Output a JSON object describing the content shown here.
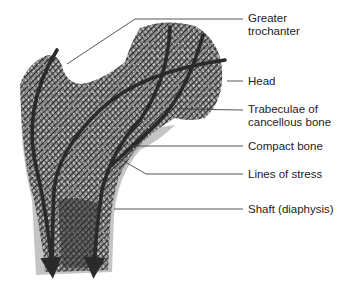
{
  "figure": {
    "labels": [
      {
        "id": "greater-trochanter",
        "lines": [
          "Greater",
          "trochanter"
        ],
        "x": 248,
        "y": 12
      },
      {
        "id": "head",
        "lines": [
          "Head"
        ],
        "x": 248,
        "y": 75
      },
      {
        "id": "trabeculae",
        "lines": [
          "Trabeculae of",
          "cancellous bone"
        ],
        "x": 248,
        "y": 103
      },
      {
        "id": "compact-bone",
        "lines": [
          "Compact bone"
        ],
        "x": 248,
        "y": 140
      },
      {
        "id": "lines-of-stress",
        "lines": [
          "Lines of stress"
        ],
        "x": 248,
        "y": 168
      },
      {
        "id": "shaft",
        "lines": [
          "Shaft (diaphysis)"
        ],
        "x": 248,
        "y": 203
      }
    ],
    "colors": {
      "bone_texture": "#6a6a6a",
      "bone_dark": "#2e2e2e",
      "compact_bone": "#b8b8b8",
      "stress_lines": "#2a2a2a",
      "leader_lines": "#444444",
      "text": "#222222"
    }
  }
}
